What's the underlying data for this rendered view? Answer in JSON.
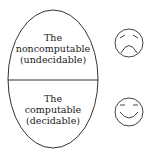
{
  "diagram": {
    "top_region": {
      "lines": [
        "The",
        "noncomputable",
        "(undecidable)"
      ],
      "icon": "sad-face-icon"
    },
    "bottom_region": {
      "lines": [
        "The",
        "computable",
        "(decidable)"
      ],
      "icon": "happy-face-icon"
    },
    "colors": {
      "stroke": "#333333",
      "background": "#ffffff"
    }
  }
}
